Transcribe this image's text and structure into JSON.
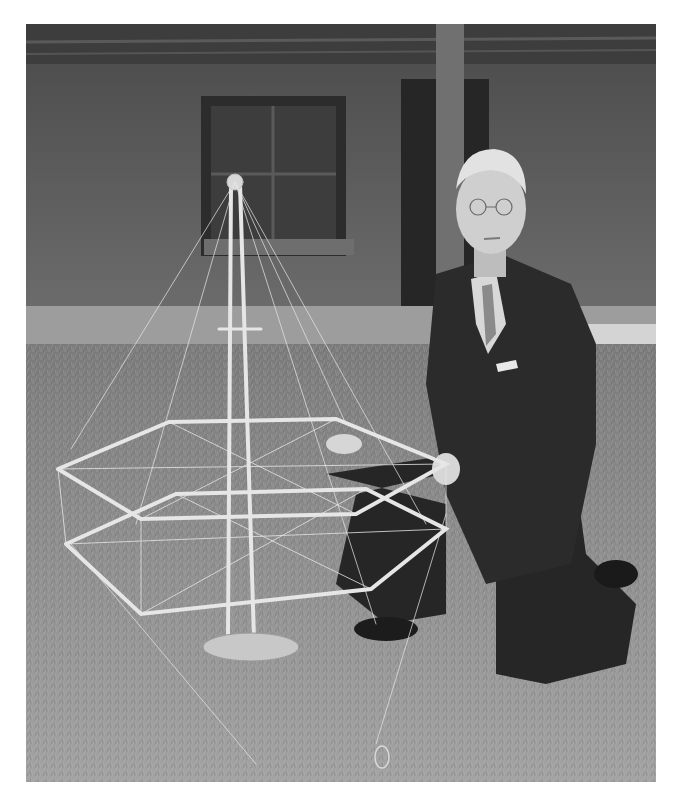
{
  "image": {
    "kind": "black-and-white photograph",
    "description": "A man in a dark suit and tie with glasses kneels on grass beside a tall model structure made of thin rods: a central mast with a ball on top, guy wires, and two stacked hexagonal frames, standing on a round base. Behind is a brick building wall with a window and a doorway, and a utility pole.",
    "palette": {
      "wall": "#5f5f5f",
      "wall_dark": "#3a3a3a",
      "grass": "#8c8c8c",
      "grass_light": "#b5b5b5",
      "rods": "#e6e6e6",
      "suit": "#2a2a2a",
      "skin": "#cfcfcf",
      "border": "#ffffff"
    }
  }
}
